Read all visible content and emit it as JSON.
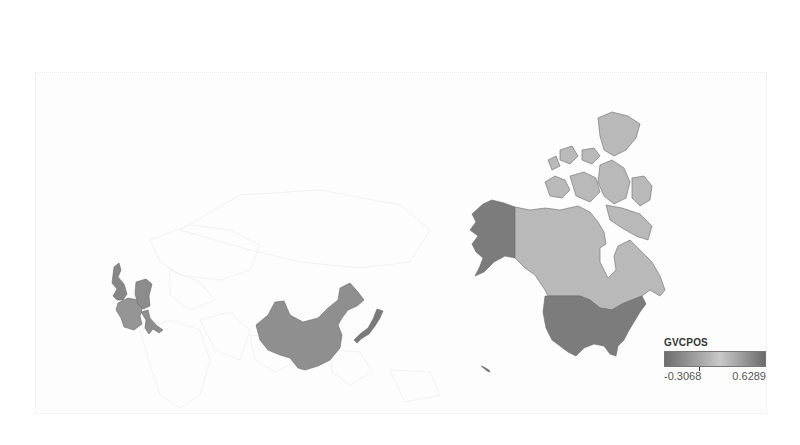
{
  "map": {
    "type": "choropleth",
    "projection": "world",
    "variable": "GVCPOS",
    "highlighted_countries": [
      {
        "name": "United States",
        "shade": "dark",
        "color": "#7c7c7c"
      },
      {
        "name": "Canada",
        "shade": "light",
        "color": "#b9b9b9"
      },
      {
        "name": "China",
        "shade": "medium",
        "color": "#8f8f8f"
      },
      {
        "name": "Japan",
        "shade": "dark",
        "color": "#7a7a7a"
      },
      {
        "name": "United Kingdom",
        "shade": "medium-dark",
        "color": "#878787"
      },
      {
        "name": "France",
        "shade": "medium",
        "color": "#959595"
      },
      {
        "name": "Germany",
        "shade": "medium",
        "color": "#8c8c8c"
      },
      {
        "name": "Italy",
        "shade": "medium",
        "color": "#8e8e8e"
      }
    ],
    "background_stroke": "#ededed"
  },
  "legend": {
    "title": "GVCPOS",
    "min_label": "-0.3068",
    "max_label": "0.6289",
    "min_value": -0.3068,
    "max_value": 0.6289,
    "gradient": [
      "#6e6e6e",
      "#a6a6a6",
      "#c9c9c9",
      "#a0a0a0",
      "#6a6a6a"
    ]
  }
}
